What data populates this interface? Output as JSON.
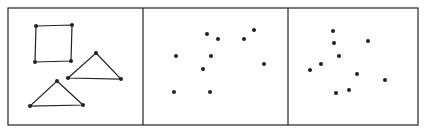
{
  "figure": {
    "frame": {
      "x": 8,
      "y": 8,
      "width": 410,
      "height": 117
    },
    "dividers": [
      143,
      288
    ],
    "panels": [
      {
        "name": "connected-shapes",
        "square": [
          [
            36,
            26
          ],
          [
            72,
            25
          ],
          [
            71,
            61
          ],
          [
            35,
            62
          ]
        ],
        "triangles": [
          [
            [
              96,
              53
            ],
            [
              121,
              79
            ],
            [
              68,
              78
            ]
          ],
          [
            [
              57,
              81
            ],
            [
              83,
              105
            ],
            [
              30,
              106
            ]
          ]
        ]
      },
      {
        "name": "scattered-dots-a",
        "dots": [
          [
            207,
            34
          ],
          [
            218,
            39
          ],
          [
            244,
            39
          ],
          [
            254,
            30
          ],
          [
            176,
            56
          ],
          [
            211,
            56
          ],
          [
            203,
            69
          ],
          [
            264,
            64
          ],
          [
            174,
            92
          ],
          [
            210,
            92
          ]
        ]
      },
      {
        "name": "scattered-dots-b",
        "dots": [
          [
            333,
            31
          ],
          [
            334,
            43
          ],
          [
            368,
            41
          ],
          [
            339,
            56
          ],
          [
            321,
            64
          ],
          [
            310,
            70
          ],
          [
            357,
            74
          ],
          [
            385,
            80
          ],
          [
            349,
            90
          ],
          [
            336,
            93
          ]
        ]
      }
    ],
    "color": "#222222"
  }
}
